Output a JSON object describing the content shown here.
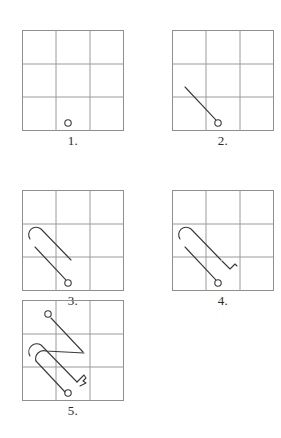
{
  "figure": {
    "title": "",
    "background_color": "#ffffff",
    "grid": {
      "rows": 3,
      "cols": 3,
      "line_color": "#9a9a9a",
      "border_color": "#8f8f8f",
      "line_width": 1,
      "width": 102,
      "height": 101
    },
    "ink": {
      "stroke_color": "#3a3a3a",
      "stroke_width": 1.1
    },
    "panels": [
      {
        "id": "panel-1",
        "caption": "1.",
        "x": 22,
        "y": 30,
        "elements": [
          "start-circle"
        ],
        "start_circle": {
          "cx": 46,
          "cy": 93,
          "r": 3.2
        }
      },
      {
        "id": "panel-2",
        "caption": "2.",
        "x": 172,
        "y": 30,
        "elements": [
          "start-circle",
          "diagonal-line"
        ],
        "start_circle": {
          "cx": 46,
          "cy": 93,
          "r": 3.2
        },
        "diagonal_line": {
          "x1": 13,
          "y1": 57,
          "x2": 44,
          "y2": 90
        }
      },
      {
        "id": "panel-3",
        "caption": "3.",
        "x": 22,
        "y": 190,
        "elements": [
          "start-circle",
          "diagonal-line",
          "outer-hairpin"
        ],
        "start_circle": {
          "cx": 46,
          "cy": 93,
          "r": 3.2
        },
        "diagonal_line": {
          "x1": 13,
          "y1": 57,
          "x2": 44,
          "y2": 90
        },
        "outer_hairpin": "U-shaped bend at upper-left with two parallel strokes running to lower-right"
      },
      {
        "id": "panel-4",
        "caption": "4.",
        "x": 172,
        "y": 190,
        "elements": [
          "start-circle",
          "diagonal-line",
          "outer-hairpin",
          "zigzag-hook"
        ],
        "start_circle": {
          "cx": 46,
          "cy": 93,
          "r": 3.2
        },
        "zigzag_hook": "small z-shaped hook to the upper-right of the circle"
      },
      {
        "id": "panel-5",
        "caption": "5.",
        "x": 22,
        "y": 300,
        "elements": [
          "start-circle",
          "end-circle",
          "outer-hairpin",
          "inner-hairpin",
          "tail-hook"
        ],
        "start_circle": {
          "cx": 46,
          "cy": 93,
          "r": 3.2
        },
        "end_circle": {
          "cx": 26,
          "cy": 14,
          "r": 3.2
        },
        "tail_hook": "notched tail at lower-right completing the paperclip"
      }
    ]
  }
}
